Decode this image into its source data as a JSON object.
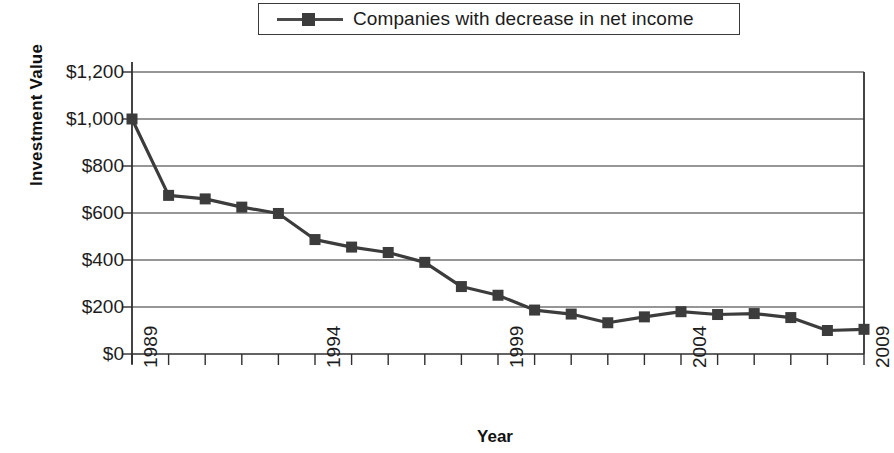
{
  "chart_data": {
    "type": "line",
    "title": "",
    "xlabel": "Year",
    "ylabel": "Investment Value",
    "legend_position": "top-center",
    "grid": true,
    "x": [
      1989,
      1990,
      1991,
      1992,
      1993,
      1994,
      1995,
      1996,
      1997,
      1998,
      1999,
      2000,
      2001,
      2002,
      2003,
      2004,
      2005,
      2006,
      2007,
      2008,
      2009
    ],
    "xlim": [
      1989,
      2009
    ],
    "ylim": [
      0,
      1200
    ],
    "ytick_values": [
      0,
      200,
      400,
      600,
      800,
      1000,
      1200
    ],
    "ytick_labels": [
      "$0",
      "$200",
      "$400",
      "$600",
      "$800",
      "$1,000",
      "$1,200"
    ],
    "xtick_values": [
      1989,
      1994,
      1999,
      2004,
      2009
    ],
    "xtick_labels": [
      "1989",
      "1994",
      "1999",
      "2004",
      "2009"
    ],
    "series": [
      {
        "name": "Companies with decrease in net income",
        "marker": "square",
        "color": "#3c3c3c",
        "values": [
          1000,
          675,
          660,
          625,
          598,
          487,
          455,
          432,
          390,
          287,
          250,
          187,
          170,
          133,
          158,
          180,
          168,
          172,
          155,
          100,
          105
        ]
      }
    ]
  },
  "legend": {
    "entries": [
      {
        "label": "Companies with decrease in net income",
        "marker_name": "legend-marker-square"
      }
    ]
  },
  "axes": {
    "y_title": "Investment Value",
    "x_title": "Year"
  }
}
